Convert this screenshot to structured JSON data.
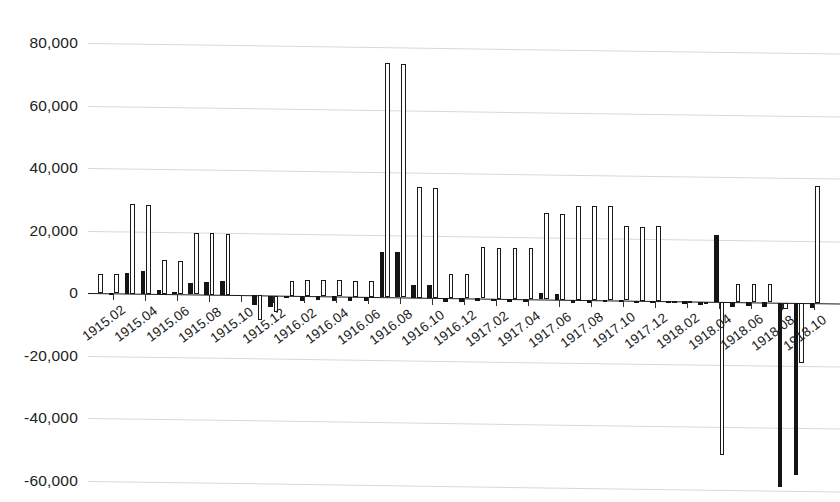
{
  "chart_data": {
    "type": "bar",
    "title": "",
    "subtitle": "",
    "xlabel": "",
    "ylabel": "",
    "ylim": [
      -68000,
      86000
    ],
    "y_ticks": [
      80000,
      60000,
      40000,
      20000,
      0,
      -20000,
      -40000,
      -60000
    ],
    "y_tick_labels": [
      "80,000",
      "60,000",
      "40,000",
      "20,000",
      "0",
      "-20,000",
      "-40,000",
      "-60,000"
    ],
    "grid": true,
    "grid_axis": "y",
    "legend": "none",
    "legend_position": "none",
    "bar_style": "paired-monthly",
    "x_tick_labels": [
      "1915.02",
      "1915.04",
      "1915.06",
      "1915.08",
      "1915.10",
      "1915.12",
      "1916.02",
      "1916.04",
      "1916.06",
      "1916.08",
      "1916.10",
      "1916.12",
      "1917.02",
      "1917.04",
      "1917.06",
      "1917.08",
      "1917.10",
      "1917.12",
      "1918.02",
      "1918.04",
      "1918.06",
      "1918.08",
      "1918.10"
    ],
    "categories": [
      "1915.01",
      "1915.02",
      "1915.03",
      "1915.04",
      "1915.05",
      "1915.06",
      "1915.07",
      "1915.08",
      "1915.09",
      "1915.10",
      "1915.11",
      "1915.12",
      "1916.01",
      "1916.02",
      "1916.03",
      "1916.04",
      "1916.05",
      "1916.06",
      "1916.07",
      "1916.08",
      "1916.09",
      "1916.10",
      "1916.11",
      "1916.12",
      "1917.01",
      "1917.02",
      "1917.03",
      "1917.04",
      "1917.05",
      "1917.06",
      "1917.07",
      "1917.08",
      "1917.09",
      "1917.10",
      "1917.11",
      "1917.12",
      "1918.01",
      "1918.02",
      "1918.03",
      "1918.04",
      "1918.05",
      "1918.06",
      "1918.07",
      "1918.08",
      "1918.09",
      "1918.10"
    ],
    "series": [
      {
        "name": "series-black",
        "color": "#151515",
        "fill": "solid",
        "values": [
          0,
          200,
          6500,
          7200,
          1200,
          700,
          3800,
          4200,
          4300,
          0,
          -3200,
          -3600,
          -800,
          -1600,
          -1300,
          -1500,
          -1400,
          -1300,
          14500,
          14400,
          4100,
          4200,
          -1200,
          -1100,
          -700,
          -600,
          -900,
          -800,
          1900,
          1800,
          -1100,
          -1000,
          -600,
          -500,
          -400,
          -400,
          -600,
          -900,
          -1000,
          21500,
          -1500,
          -1300,
          -1400,
          -59000,
          -55000,
          -1500
        ]
      },
      {
        "name": "series-white",
        "color": "#ffffff",
        "fill": "hollow",
        "values": [
          6200,
          6100,
          28500,
          28400,
          10800,
          10700,
          19600,
          19700,
          19600,
          0,
          -7800,
          -5200,
          4600,
          5000,
          5200,
          5100,
          5000,
          5100,
          74800,
          74700,
          35300,
          35200,
          7600,
          7700,
          16400,
          16300,
          16200,
          16300,
          27600,
          27500,
          30000,
          30100,
          30000,
          23800,
          23700,
          23800,
          -400,
          -500,
          -600,
          -49000,
          5600,
          5700,
          5800,
          -2000,
          -19200,
          37500
        ]
      }
    ]
  }
}
